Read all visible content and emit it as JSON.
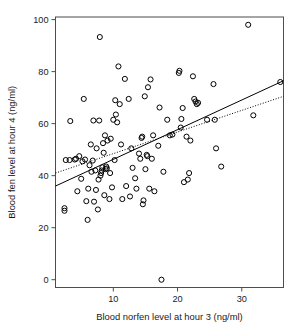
{
  "chart_data": {
    "type": "scatter",
    "title": "",
    "xlabel": "Blood norfen level at hour 3 (ng/ml)",
    "ylabel": "Blood fen level at hour 4 (ng/ml)",
    "xlim": [
      1.0,
      36.5
    ],
    "ylim": [
      -3.0,
      101.0
    ],
    "xticks": [
      10,
      20,
      30
    ],
    "xtick_labels": [
      "10",
      "20",
      "30"
    ],
    "yticks": [
      0,
      20,
      40,
      60,
      80,
      100
    ],
    "ytick_labels": [
      "0",
      "20",
      "40",
      "60",
      "80",
      "100"
    ],
    "grid": false,
    "legend": "none",
    "marker": "open-circle",
    "point_color": "#000000",
    "frame_color": "#4d4d4d",
    "points": [
      [
        2.4,
        26.5
      ],
      [
        2.4,
        27.5
      ],
      [
        2.6,
        46.0
      ],
      [
        3.2,
        46.0
      ],
      [
        3.3,
        61.0
      ],
      [
        4.0,
        46.2
      ],
      [
        4.2,
        46.5
      ],
      [
        4.4,
        34.0
      ],
      [
        4.7,
        47.5
      ],
      [
        5.0,
        38.8
      ],
      [
        5.2,
        45.5
      ],
      [
        5.4,
        69.5
      ],
      [
        5.6,
        46.2
      ],
      [
        5.8,
        30.2
      ],
      [
        6.0,
        23.0
      ],
      [
        6.1,
        35.0
      ],
      [
        6.3,
        44.0
      ],
      [
        6.5,
        52.0
      ],
      [
        6.6,
        41.5
      ],
      [
        6.8,
        45.8
      ],
      [
        6.9,
        61.2
      ],
      [
        7.0,
        30.0
      ],
      [
        7.2,
        42.0
      ],
      [
        7.3,
        34.5
      ],
      [
        7.4,
        50.5
      ],
      [
        7.6,
        27.0
      ],
      [
        7.7,
        38.5
      ],
      [
        7.8,
        61.2
      ],
      [
        7.9,
        93.3
      ],
      [
        8.0,
        40.0
      ],
      [
        8.1,
        41.0
      ],
      [
        8.2,
        42.0
      ],
      [
        8.3,
        43.2
      ],
      [
        8.4,
        52.5
      ],
      [
        8.5,
        48.8
      ],
      [
        8.6,
        32.5
      ],
      [
        8.7,
        55.5
      ],
      [
        8.8,
        42.5
      ],
      [
        8.9,
        43.5
      ],
      [
        9.0,
        42.8
      ],
      [
        9.1,
        53.5
      ],
      [
        9.4,
        31.0
      ],
      [
        9.5,
        41.0
      ],
      [
        9.6,
        54.2
      ],
      [
        9.8,
        35.5
      ],
      [
        10.0,
        61.5
      ],
      [
        10.2,
        46.0
      ],
      [
        10.3,
        69.0
      ],
      [
        10.4,
        63.5
      ],
      [
        10.6,
        60.5
      ],
      [
        10.8,
        82.0
      ],
      [
        11.0,
        67.5
      ],
      [
        11.2,
        52.0
      ],
      [
        11.4,
        31.0
      ],
      [
        11.8,
        77.2
      ],
      [
        12.0,
        36.0
      ],
      [
        12.4,
        69.5
      ],
      [
        12.6,
        32.0
      ],
      [
        12.8,
        50.5
      ],
      [
        13.0,
        43.0
      ],
      [
        13.4,
        39.0
      ],
      [
        13.6,
        35.0
      ],
      [
        14.0,
        48.5
      ],
      [
        14.2,
        46.5
      ],
      [
        14.4,
        54.5
      ],
      [
        14.5,
        55.0
      ],
      [
        14.6,
        29.0
      ],
      [
        14.7,
        30.5
      ],
      [
        14.9,
        70.5
      ],
      [
        15.0,
        42.5
      ],
      [
        15.2,
        48.0
      ],
      [
        15.3,
        47.5
      ],
      [
        15.4,
        74.0
      ],
      [
        15.6,
        35.0
      ],
      [
        15.8,
        77.0
      ],
      [
        16.0,
        46.5
      ],
      [
        16.2,
        55.5
      ],
      [
        16.4,
        34.0
      ],
      [
        17.0,
        51.5
      ],
      [
        17.2,
        66.2
      ],
      [
        17.5,
        0.0
      ],
      [
        17.8,
        41.5
      ],
      [
        18.4,
        61.5
      ],
      [
        18.8,
        55.5
      ],
      [
        19.2,
        55.8
      ],
      [
        20.2,
        79.5
      ],
      [
        20.3,
        80.3
      ],
      [
        20.5,
        58.5
      ],
      [
        20.6,
        61.8
      ],
      [
        20.8,
        66.0
      ],
      [
        21.0,
        37.5
      ],
      [
        21.4,
        55.0
      ],
      [
        21.6,
        38.5
      ],
      [
        21.8,
        41.0
      ],
      [
        22.0,
        53.5
      ],
      [
        22.4,
        78.2
      ],
      [
        22.6,
        69.5
      ],
      [
        22.8,
        68.5
      ],
      [
        23.0,
        67.5
      ],
      [
        23.2,
        68.0
      ],
      [
        24.6,
        61.5
      ],
      [
        25.6,
        75.2
      ],
      [
        25.8,
        61.5
      ],
      [
        26.0,
        50.5
      ],
      [
        26.8,
        43.5
      ],
      [
        31.0,
        98.0
      ],
      [
        31.8,
        63.2
      ],
      [
        36.0,
        76.0
      ]
    ],
    "fit_lines": [
      {
        "name": "solid-regression-line",
        "style": "solid",
        "x0": 1.0,
        "y0": 36.0,
        "x1": 36.5,
        "y1": 76.5
      },
      {
        "name": "dotted-regression-line",
        "style": "dotted",
        "x0": 1.0,
        "y0": 41.0,
        "x1": 36.5,
        "y1": 70.5
      }
    ]
  }
}
